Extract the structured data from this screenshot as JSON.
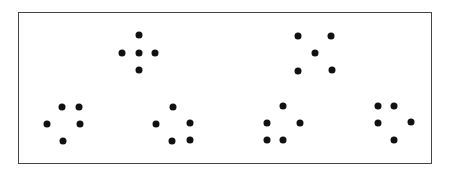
{
  "diagram": {
    "frame": {
      "x": 18,
      "y": 12,
      "width": 414,
      "height": 152,
      "border_color": "#444444"
    },
    "dot_color": "#111111",
    "dot_diameter": 7,
    "patterns": [
      {
        "id": "top-left-plus",
        "row": 1,
        "dots": [
          [
            139,
            35
          ],
          [
            122,
            53
          ],
          [
            139,
            53
          ],
          [
            155,
            53
          ],
          [
            139,
            70
          ]
        ]
      },
      {
        "id": "top-right-x",
        "row": 1,
        "dots": [
          [
            298,
            36
          ],
          [
            331,
            36
          ],
          [
            315,
            53
          ],
          [
            298,
            71
          ],
          [
            332,
            70
          ]
        ]
      },
      {
        "id": "bottom-1",
        "row": 2,
        "dots": [
          [
            62,
            107
          ],
          [
            79,
            107
          ],
          [
            47,
            124
          ],
          [
            80,
            124
          ],
          [
            63,
            141
          ]
        ]
      },
      {
        "id": "bottom-2",
        "row": 2,
        "dots": [
          [
            173,
            107
          ],
          [
            156,
            124
          ],
          [
            190,
            123
          ],
          [
            172,
            141
          ],
          [
            190,
            140
          ]
        ]
      },
      {
        "id": "bottom-3",
        "row": 2,
        "dots": [
          [
            283,
            106
          ],
          [
            267,
            123
          ],
          [
            300,
            123
          ],
          [
            267,
            140
          ],
          [
            283,
            140
          ]
        ]
      },
      {
        "id": "bottom-4",
        "row": 2,
        "dots": [
          [
            378,
            106
          ],
          [
            394,
            106
          ],
          [
            378,
            123
          ],
          [
            411,
            122
          ],
          [
            394,
            140
          ]
        ]
      }
    ]
  }
}
